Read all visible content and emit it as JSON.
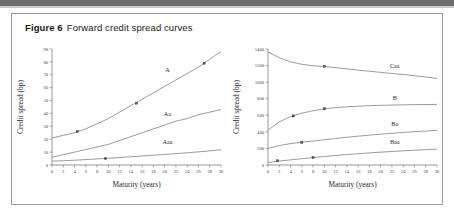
{
  "figure": {
    "label": "Figure 6",
    "title": "Forward credit spread curves"
  },
  "colors": {
    "border": "#9b9b9b",
    "axis": "#6f6f6f",
    "curve": "#7a7a7a",
    "text": "#2b2b2b",
    "top_bar": "#6d6d6d"
  },
  "chart_data": [
    {
      "type": "line",
      "title": "",
      "xlabel": "Maturity (years)",
      "ylabel": "Credit spread (bp)",
      "xlim": [
        0,
        30
      ],
      "ylim": [
        0,
        90
      ],
      "xticks": [
        0,
        2,
        4,
        6,
        8,
        10,
        12,
        14,
        16,
        18,
        20,
        22,
        24,
        26,
        28,
        30
      ],
      "yticks": [
        0,
        10,
        20,
        30,
        40,
        50,
        60,
        70,
        80,
        90
      ],
      "grid": false,
      "legend": "inline-labels",
      "x": [
        0,
        2,
        4,
        6,
        8,
        10,
        12,
        14,
        16,
        18,
        20,
        22,
        24,
        26,
        28,
        30
      ],
      "series": [
        {
          "name": "A",
          "values": [
            21,
            23,
            25,
            28,
            32,
            36,
            41,
            46,
            51,
            56,
            61,
            66,
            71,
            76,
            82,
            88
          ],
          "markers": [
            {
              "x": 4.5,
              "y": 26
            },
            {
              "x": 15,
              "y": 48
            },
            {
              "x": 27,
              "y": 79
            }
          ],
          "label_x": 20.5,
          "label_y": 72
        },
        {
          "name": "Aa",
          "values": [
            6,
            8,
            10,
            12,
            14,
            16,
            19,
            22,
            25,
            28,
            31,
            34,
            36,
            39,
            41,
            43
          ],
          "markers": [],
          "label_x": 20.5,
          "label_y": 38
        },
        {
          "name": "Aaa",
          "values": [
            3,
            3.3,
            3.7,
            4.2,
            4.7,
            5.2,
            5.8,
            6.4,
            7.0,
            7.6,
            8.2,
            8.8,
            9.5,
            10.2,
            11.0,
            11.8
          ],
          "markers": [
            {
              "x": 9.5,
              "y": 5.0
            }
          ],
          "label_x": 20.5,
          "label_y": 16.5
        }
      ]
    },
    {
      "type": "line",
      "title": "",
      "xlabel": "Maturity (years)",
      "ylabel": "Credit spread (bp)",
      "xlim": [
        0,
        30
      ],
      "ylim": [
        0,
        1400
      ],
      "xticks": [
        0,
        2,
        4,
        6,
        8,
        10,
        12,
        14,
        16,
        18,
        20,
        22,
        24,
        26,
        28,
        30
      ],
      "yticks": [
        0,
        200,
        400,
        600,
        800,
        1000,
        1200,
        1400
      ],
      "grid": false,
      "legend": "inline-labels",
      "x": [
        0,
        2,
        4,
        6,
        8,
        10,
        12,
        14,
        16,
        18,
        20,
        22,
        24,
        26,
        28,
        30
      ],
      "series": [
        {
          "name": "Caa",
          "values": [
            1365,
            1295,
            1245,
            1215,
            1198,
            1188,
            1175,
            1160,
            1145,
            1132,
            1118,
            1105,
            1092,
            1078,
            1062,
            1045
          ],
          "markers": [
            {
              "x": 10,
              "y": 1190
            }
          ],
          "label_x": 22.5,
          "label_y": 1175
        },
        {
          "name": "B",
          "values": [
            420,
            520,
            585,
            625,
            655,
            678,
            692,
            702,
            710,
            716,
            720,
            723,
            726,
            728,
            730,
            731
          ],
          "markers": [
            {
              "x": 4.5,
              "y": 592
            },
            {
              "x": 10,
              "y": 678
            }
          ],
          "label_x": 22.5,
          "label_y": 790
        },
        {
          "name": "Ba",
          "values": [
            200,
            235,
            258,
            275,
            290,
            305,
            320,
            335,
            348,
            360,
            372,
            383,
            393,
            402,
            410,
            418
          ],
          "markers": [
            {
              "x": 6,
              "y": 272
            }
          ],
          "label_x": 22.5,
          "label_y": 470
        },
        {
          "name": "Baa",
          "values": [
            30,
            48,
            62,
            76,
            90,
            103,
            115,
            126,
            136,
            146,
            155,
            163,
            171,
            178,
            185,
            192
          ],
          "markers": [
            {
              "x": 1.7,
              "y": 50
            },
            {
              "x": 8,
              "y": 90
            }
          ],
          "label_x": 22.5,
          "label_y": 252
        }
      ]
    }
  ]
}
